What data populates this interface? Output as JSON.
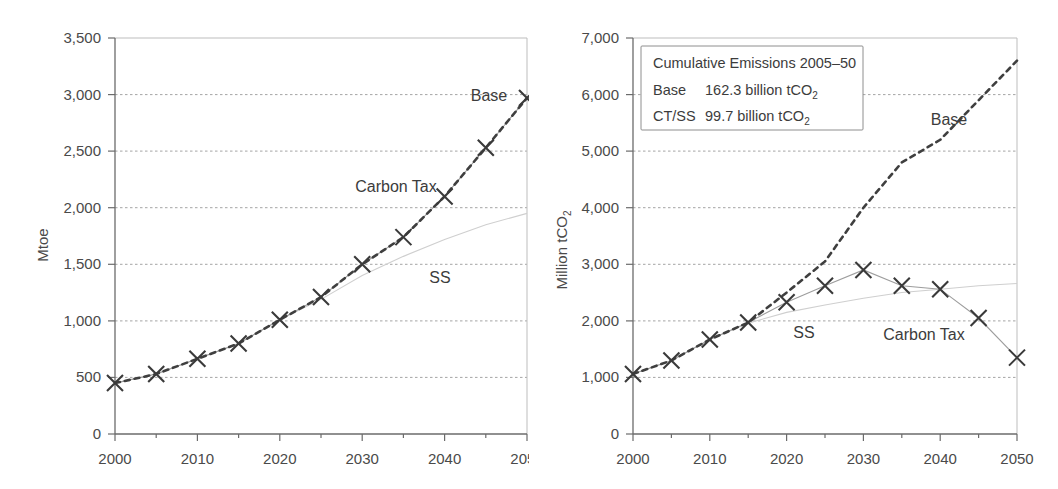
{
  "figure": {
    "name": "two-panel-energy-emissions-projection"
  },
  "chart_data": [
    {
      "id": "left",
      "type": "line",
      "title": "",
      "xlabel": "",
      "ylabel": "Mtoe",
      "xlim": [
        2000,
        2050
      ],
      "ylim": [
        0,
        3500
      ],
      "xticks": [
        2000,
        2010,
        2020,
        2030,
        2040,
        2050
      ],
      "xticklabels": [
        "2000",
        "2010",
        "2020",
        "2030",
        "2040",
        "2050"
      ],
      "xminorticks": [
        2005,
        2015,
        2025,
        2035,
        2045
      ],
      "yticks": [
        0,
        500,
        1000,
        1500,
        2000,
        2500,
        3000,
        3500
      ],
      "yticklabels": [
        "0",
        "500",
        "1,000",
        "1,500",
        "2,000",
        "2,500",
        "3,000",
        "3,500"
      ],
      "grid": "horizontal-dotted",
      "legend": "inline-annotations",
      "x": [
        2000,
        2005,
        2010,
        2015,
        2020,
        2025,
        2030,
        2035,
        2040,
        2045,
        2050
      ],
      "series": [
        {
          "name": "Base",
          "style": "dashed-thick",
          "annotation": "Base",
          "values": [
            450,
            530,
            665,
            800,
            1010,
            1210,
            1500,
            1740,
            2100,
            2530,
            2970
          ]
        },
        {
          "name": "Carbon Tax",
          "style": "solid-thin-with-x-markers",
          "annotation": "Carbon Tax",
          "values": [
            450,
            530,
            665,
            800,
            1010,
            1210,
            1500,
            1740,
            2100,
            2530,
            2970
          ]
        },
        {
          "name": "SS",
          "style": "faint-thin",
          "annotation": "SS",
          "values": [
            450,
            530,
            665,
            800,
            1010,
            1190,
            1400,
            1570,
            1720,
            1850,
            1950
          ]
        }
      ]
    },
    {
      "id": "right",
      "type": "line",
      "title": "",
      "xlabel": "",
      "ylabel": "Million tCO2",
      "xlim": [
        2000,
        2050
      ],
      "ylim": [
        0,
        7000
      ],
      "xticks": [
        2000,
        2010,
        2020,
        2030,
        2040,
        2050
      ],
      "xticklabels": [
        "2000",
        "2010",
        "2020",
        "2030",
        "2040",
        "2050"
      ],
      "xminorticks": [
        2005,
        2015,
        2025,
        2035,
        2045
      ],
      "yticks": [
        0,
        1000,
        2000,
        3000,
        4000,
        5000,
        6000,
        7000
      ],
      "yticklabels": [
        "0",
        "1,000",
        "2,000",
        "3,000",
        "4,000",
        "5,000",
        "6,000",
        "7,000"
      ],
      "grid": "horizontal-dotted",
      "legend": "box-top-left",
      "x": [
        2000,
        2005,
        2010,
        2015,
        2020,
        2025,
        2030,
        2035,
        2040,
        2045,
        2050
      ],
      "series": [
        {
          "name": "Base",
          "style": "dashed-thick",
          "annotation": "Base",
          "values": [
            1060,
            1300,
            1670,
            1970,
            2500,
            3050,
            4000,
            4800,
            5200,
            5900,
            6600
          ]
        },
        {
          "name": "Carbon Tax",
          "style": "solid-thin-with-x-markers",
          "annotation": "Carbon Tax",
          "values": [
            1060,
            1300,
            1670,
            1970,
            2330,
            2620,
            2900,
            2620,
            2560,
            2050,
            1350
          ]
        },
        {
          "name": "SS",
          "style": "faint-thin",
          "annotation": "SS",
          "values": [
            1060,
            1300,
            1670,
            1960,
            2150,
            2280,
            2400,
            2500,
            2560,
            2620,
            2660
          ]
        }
      ],
      "legend_box": {
        "title": "Cumulative Emissions 2005–50",
        "rows": [
          {
            "label": "Base",
            "value": "162.3 billion tCO",
            "sub": "2"
          },
          {
            "label": "CT/SS",
            "value": "99.7 billion tCO",
            "sub": "2"
          }
        ]
      }
    }
  ],
  "left_panel": {
    "ylabel": "Mtoe",
    "annotations": {
      "base": "Base",
      "carbon_tax": "Carbon Tax",
      "ss": "SS"
    },
    "yticklabels": [
      "3,500",
      "3,000",
      "2,500",
      "2,000",
      "1,500",
      "1,000",
      "500",
      "0"
    ],
    "xticklabels": [
      "2000",
      "2010",
      "2020",
      "2030",
      "2040",
      "2050"
    ]
  },
  "right_panel": {
    "ylabel_main": "Million tCO",
    "ylabel_sub": "2",
    "annotations": {
      "base": "Base",
      "carbon_tax": "Carbon Tax",
      "ss": "SS"
    },
    "yticklabels": [
      "7,000",
      "6,000",
      "5,000",
      "4,000",
      "3,000",
      "2,000",
      "1,000",
      "0"
    ],
    "xticklabels": [
      "2000",
      "2010",
      "2020",
      "2030",
      "2040",
      "2050"
    ],
    "legend": {
      "title": "Cumulative Emissions 2005–50",
      "row1_label": "Base",
      "row1_value": "162.3 billion tCO",
      "row1_sub": "2",
      "row2_label": "CT/SS",
      "row2_value": "99.7 billion tCO",
      "row2_sub": "2"
    }
  },
  "colors": {
    "axis": "#6b6b6b",
    "grid": "#9a9a9a",
    "dashed_series": "#3f3f3f",
    "solid_series": "#9d9d9d",
    "faint_series": "#cfcfcf",
    "text": "#3a3a3a"
  }
}
